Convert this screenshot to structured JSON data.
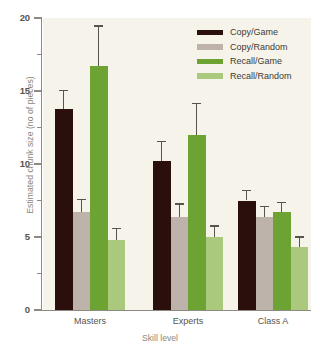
{
  "figure": {
    "top_sliver_text": "",
    "plot_background": "#f6f3ea",
    "page_background": "#ffffff",
    "axis_color": "#8d8a82"
  },
  "chart_data": {
    "type": "bar",
    "title": "",
    "xlabel": "Skill level",
    "ylabel": "Estimated chunk size (no of pieces)",
    "categories": [
      "Masters",
      "Experts",
      "Class A"
    ],
    "ylim": [
      0,
      20
    ],
    "ytick_labels": [
      "0",
      "5",
      "10",
      "15",
      "20"
    ],
    "ytick_values": [
      0,
      5,
      10,
      15,
      20
    ],
    "yminor_values": [
      2.5,
      7.5,
      12.5,
      17.5
    ],
    "grid": false,
    "legend_position": "top-right",
    "series": [
      {
        "name": "Copy/Game",
        "color": "#2a0f0c",
        "values": [
          13.8,
          10.2,
          7.5
        ],
        "errors": [
          1.3,
          1.4,
          0.75
        ]
      },
      {
        "name": "Copy/Random",
        "color": "#bdb3ab",
        "values": [
          6.7,
          6.4,
          6.4
        ],
        "errors": [
          0.9,
          0.9,
          0.75
        ]
      },
      {
        "name": "Recall/Game",
        "color": "#6ca332",
        "values": [
          16.7,
          12.0,
          6.7
        ],
        "errors": [
          2.8,
          2.2,
          0.7
        ]
      },
      {
        "name": "Recall/Random",
        "color": "#aac97d",
        "values": [
          4.8,
          5.0,
          4.3
        ],
        "errors": [
          0.85,
          0.8,
          0.75
        ]
      }
    ]
  },
  "legend": {
    "items": [
      {
        "label": "Copy/Game",
        "color": "#2a0f0c"
      },
      {
        "label": "Copy/Random",
        "color": "#bdb3ab"
      },
      {
        "label": "Recall/Game",
        "color": "#6ca332"
      },
      {
        "label": "Recall/Random",
        "color": "#aac97d"
      }
    ]
  }
}
